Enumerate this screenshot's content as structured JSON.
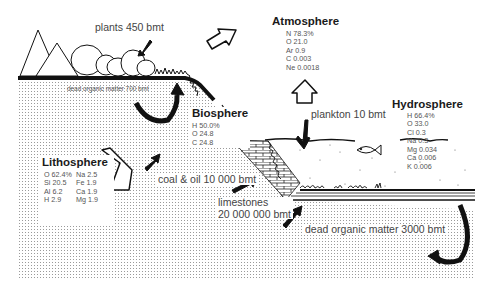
{
  "diagram": {
    "spheres": {
      "atmosphere": {
        "title": "Atmosphere",
        "elements": [
          "N 78.3%",
          "O 21.0",
          "Ar 0.9",
          "C 0.003",
          "Ne 0.0018"
        ]
      },
      "biosphere": {
        "title": "Biosphere",
        "elements": [
          "H 50.0%",
          "O 24.8",
          "C 24.8"
        ]
      },
      "hydrosphere": {
        "title": "Hydrosphere",
        "elements": [
          "H 66.4%",
          "O 33.0",
          "Cl 0.3",
          "Na 0.3",
          "Mg 0.034",
          "Ca 0.006",
          "K 0.006"
        ]
      },
      "lithosphere": {
        "title": "Lithosphere",
        "elements_left": [
          "O 62.4%",
          "Si 20.5",
          "Al 6.2",
          "H 2.9"
        ],
        "elements_right": [
          "Na 2.5",
          "Fe 1.9",
          "Ca 1.9",
          "Mg 1.9"
        ]
      }
    },
    "reservoirs": {
      "plants": "plants 450 bmt",
      "dead_organic_land": "dead organic matter  700 bmt",
      "plankton": "plankton 10 bmt",
      "coal_oil": "coal & oil 10 000 bmt",
      "limestones_line1": "limestones",
      "limestones_line2": "20 000 000 bmt",
      "dead_organic_sea": "dead organic matter 3000 bmt"
    },
    "colors": {
      "ink": "#111111",
      "text": "#444444",
      "dots": "#9a9a9a",
      "background": "#ffffff"
    }
  }
}
